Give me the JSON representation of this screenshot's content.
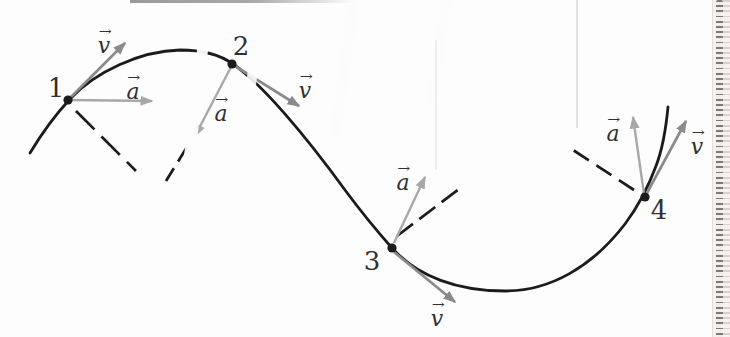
{
  "figure": {
    "type": "trajectory-vector-diagram",
    "points": [
      {
        "label": "1"
      },
      {
        "label": "2"
      },
      {
        "label": "3"
      },
      {
        "label": "4"
      }
    ],
    "vectors": {
      "velocity_symbol": "v",
      "acceleration_symbol": "a",
      "arrow_glyph": "→"
    },
    "colors": {
      "curve": "#1b1b1b",
      "velocity_arrow": "#8a8a8a",
      "acceleration_arrow": "#a8a8a8",
      "label_text": "#303030",
      "edge_bg": "#f6f1f0"
    }
  }
}
